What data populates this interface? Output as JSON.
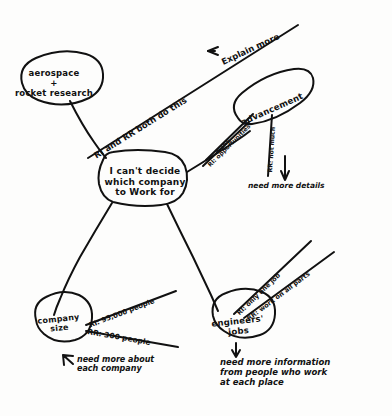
{
  "diagram": {
    "title": "I can't decide which company to work for",
    "type": "hand-drawn mind map",
    "ink_color": "#111111",
    "paper_color": "#fdfdfc",
    "legend": {
      "RI": "RI",
      "RR": "RR"
    },
    "nodes": [
      {
        "id": "center",
        "label": "I can't decide\nwhich company\nto Work for",
        "shape": "rounded-rect"
      },
      {
        "id": "aerospace",
        "label": "aerospace\n+\nrocket research",
        "shape": "ellipse"
      },
      {
        "id": "advancement",
        "label": "advancement",
        "shape": "ellipse"
      },
      {
        "id": "company_size",
        "label": "company\nsize",
        "shape": "ellipse"
      },
      {
        "id": "engineers",
        "label": "engineers'\njobs",
        "shape": "ellipse"
      }
    ],
    "edge_labels": [
      {
        "id": "both-do-this",
        "text": "RI and RR both do this"
      },
      {
        "id": "many",
        "text": "many"
      },
      {
        "id": "ri-opportunity",
        "text": "RI: opportunities"
      },
      {
        "id": "rr-not-much",
        "text": "RR: not much"
      },
      {
        "id": "ri-people",
        "text": "RI: 95,000 people"
      },
      {
        "id": "rr-people",
        "text": "RR: 300 people"
      },
      {
        "id": "ri-one-job",
        "text": "RI: only one job"
      },
      {
        "id": "rr-all-parts",
        "text": "RR: work on all parts"
      }
    ],
    "annotations": [
      {
        "id": "explain-more",
        "text": "Explain more",
        "arrow": "←"
      },
      {
        "id": "need-details",
        "text": "need more details",
        "arrow": "↑"
      },
      {
        "id": "need-company",
        "text": "need more about\neach company",
        "arrow": "←"
      },
      {
        "id": "need-information",
        "text": "need more information\nfrom people who work\nat each place",
        "arrow": "↑"
      }
    ]
  }
}
